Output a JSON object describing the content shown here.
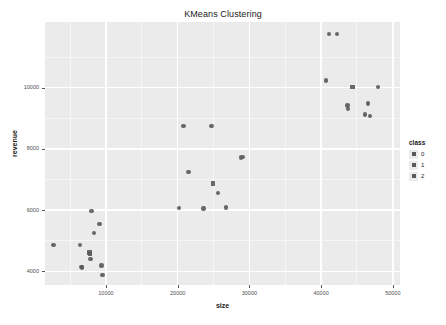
{
  "chart_data": {
    "type": "scatter",
    "title": "KMeans Clustering",
    "xlabel": "size",
    "ylabel": "revenue",
    "xlim": [
      1500,
      51000
    ],
    "ylim": [
      3550,
      12150
    ],
    "grid": true,
    "legend_position": "right",
    "x_ticks": [
      {
        "value": 10000,
        "label": "10000"
      },
      {
        "value": 20000,
        "label": "20000"
      },
      {
        "value": 30000,
        "label": "30000"
      },
      {
        "value": 40000,
        "label": "40000"
      },
      {
        "value": 50000,
        "label": "50000"
      }
    ],
    "y_ticks": [
      {
        "value": 4000,
        "label": "4000"
      },
      {
        "value": 6000,
        "label": "6000"
      },
      {
        "value": 8000,
        "label": "8000"
      },
      {
        "value": 10000,
        "label": "10000"
      }
    ],
    "x_minor_ticks": [
      5000,
      15000,
      25000,
      35000,
      45000
    ],
    "y_minor_ticks": [
      5000,
      7000,
      9000,
      11000
    ],
    "legend": {
      "title": "class",
      "entries": [
        {
          "label": "0",
          "color": "#5b5b5b",
          "shape": "square"
        },
        {
          "label": "1",
          "color": "#5b5b5b",
          "shape": "square"
        },
        {
          "label": "2",
          "color": "#5b5b5b",
          "shape": "square"
        }
      ]
    },
    "marker_color": "#5b5b5b",
    "points": [
      {
        "x": 2700,
        "y": 4850,
        "cls": "1",
        "shape": "circle"
      },
      {
        "x": 6400,
        "y": 4860,
        "cls": "1",
        "shape": "circle"
      },
      {
        "x": 6600,
        "y": 4140,
        "cls": "1",
        "shape": "circle"
      },
      {
        "x": 6700,
        "y": 4120,
        "cls": "1",
        "shape": "circle"
      },
      {
        "x": 7700,
        "y": 4620,
        "cls": "2",
        "shape": "square"
      },
      {
        "x": 7750,
        "y": 4560,
        "cls": "2",
        "shape": "square"
      },
      {
        "x": 7850,
        "y": 4400,
        "cls": "1",
        "shape": "circle"
      },
      {
        "x": 8000,
        "y": 5960,
        "cls": "1",
        "shape": "circle"
      },
      {
        "x": 8300,
        "y": 5260,
        "cls": "1",
        "shape": "circle"
      },
      {
        "x": 9100,
        "y": 5540,
        "cls": "1",
        "shape": "circle"
      },
      {
        "x": 9400,
        "y": 4190,
        "cls": "1",
        "shape": "circle"
      },
      {
        "x": 9500,
        "y": 3870,
        "cls": "1",
        "shape": "circle"
      },
      {
        "x": 20200,
        "y": 6070,
        "cls": "0",
        "shape": "circle"
      },
      {
        "x": 20800,
        "y": 8740,
        "cls": "0",
        "shape": "circle"
      },
      {
        "x": 21500,
        "y": 7240,
        "cls": "0",
        "shape": "circle"
      },
      {
        "x": 23600,
        "y": 6050,
        "cls": "0",
        "shape": "circle"
      },
      {
        "x": 24700,
        "y": 8740,
        "cls": "0",
        "shape": "circle"
      },
      {
        "x": 24900,
        "y": 6870,
        "cls": "2",
        "shape": "square"
      },
      {
        "x": 25600,
        "y": 6560,
        "cls": "0",
        "shape": "circle"
      },
      {
        "x": 26700,
        "y": 6090,
        "cls": "0",
        "shape": "circle"
      },
      {
        "x": 28800,
        "y": 7720,
        "cls": "0",
        "shape": "circle"
      },
      {
        "x": 29100,
        "y": 7730,
        "cls": "0",
        "shape": "circle"
      },
      {
        "x": 40700,
        "y": 10240,
        "cls": "2",
        "shape": "circle"
      },
      {
        "x": 41100,
        "y": 11750,
        "cls": "2",
        "shape": "circle"
      },
      {
        "x": 42200,
        "y": 11750,
        "cls": "2",
        "shape": "circle"
      },
      {
        "x": 43700,
        "y": 9420,
        "cls": "2",
        "shape": "circle"
      },
      {
        "x": 43750,
        "y": 9300,
        "cls": "2",
        "shape": "circle"
      },
      {
        "x": 44400,
        "y": 10020,
        "cls": "2",
        "shape": "square"
      },
      {
        "x": 46100,
        "y": 9120,
        "cls": "2",
        "shape": "circle"
      },
      {
        "x": 46500,
        "y": 9480,
        "cls": "2",
        "shape": "circle"
      },
      {
        "x": 46800,
        "y": 9080,
        "cls": "2",
        "shape": "circle"
      },
      {
        "x": 47900,
        "y": 10030,
        "cls": "2",
        "shape": "circle"
      }
    ]
  }
}
